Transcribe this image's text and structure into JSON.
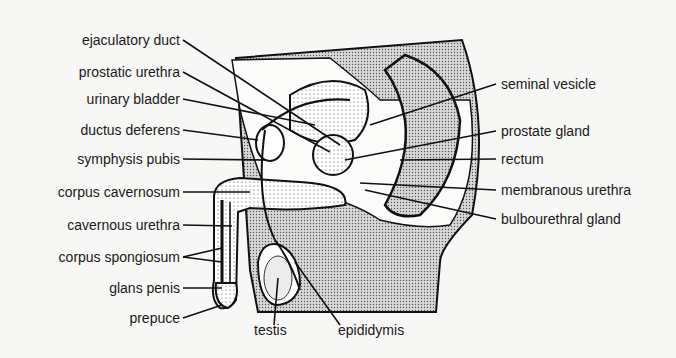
{
  "diagram": {
    "labels_left": [
      {
        "text": "ejaculatory duct",
        "x": 180,
        "y": 40
      },
      {
        "text": "prostatic urethra",
        "x": 180,
        "y": 72
      },
      {
        "text": "urinary bladder",
        "x": 180,
        "y": 99
      },
      {
        "text": "ductus deferens",
        "x": 180,
        "y": 130
      },
      {
        "text": "symphysis pubis",
        "x": 180,
        "y": 159
      },
      {
        "text": "corpus cavernosum",
        "x": 180,
        "y": 192
      },
      {
        "text": "cavernous urethra",
        "x": 180,
        "y": 225
      },
      {
        "text": "corpus spongiosum",
        "x": 180,
        "y": 257
      },
      {
        "text": "glans penis",
        "x": 180,
        "y": 288
      },
      {
        "text": "prepuce",
        "x": 180,
        "y": 318
      }
    ],
    "labels_right": [
      {
        "text": "seminal vesicle",
        "x": 501,
        "y": 84
      },
      {
        "text": "prostate gland",
        "x": 501,
        "y": 131
      },
      {
        "text": "rectum",
        "x": 501,
        "y": 159
      },
      {
        "text": "membranous urethra",
        "x": 501,
        "y": 190
      },
      {
        "text": "bulbourethral gland",
        "x": 501,
        "y": 219
      }
    ],
    "labels_bottom": [
      {
        "text": "testis",
        "x": 253,
        "y": 330
      },
      {
        "text": "epididymis",
        "x": 337,
        "y": 330
      }
    ]
  }
}
